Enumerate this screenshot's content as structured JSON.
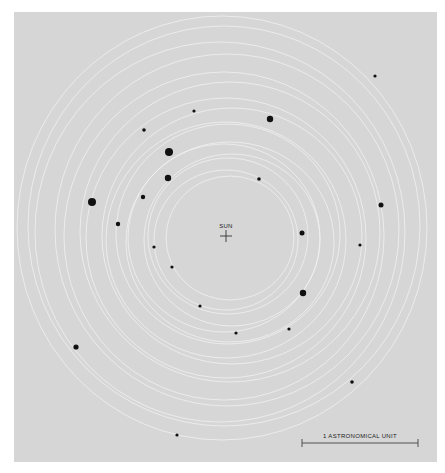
{
  "figure": {
    "background_color": "#d6d6d6",
    "orbit_color": "#f2f2f2",
    "body_color": "#111111",
    "sun": {
      "label": "SUN",
      "x": 226,
      "y": 236
    },
    "scale_bar": {
      "label": "1 ASTRONOMICAL UNIT",
      "x1": 302,
      "x2": 418,
      "y": 443
    },
    "orbits": [
      {
        "cx": 222,
        "cy": 228,
        "rx": 205,
        "ry": 212
      },
      {
        "cx": 224,
        "cy": 226,
        "rx": 196,
        "ry": 200
      },
      {
        "cx": 220,
        "cy": 232,
        "rx": 185,
        "ry": 190
      },
      {
        "cx": 227,
        "cy": 230,
        "rx": 172,
        "ry": 176
      },
      {
        "cx": 224,
        "cy": 236,
        "rx": 160,
        "ry": 164
      },
      {
        "cx": 230,
        "cy": 232,
        "rx": 150,
        "ry": 150
      },
      {
        "cx": 226,
        "cy": 238,
        "rx": 140,
        "ry": 140
      },
      {
        "cx": 232,
        "cy": 236,
        "rx": 130,
        "ry": 128
      },
      {
        "cx": 226,
        "cy": 240,
        "rx": 120,
        "ry": 118
      },
      {
        "cx": 228,
        "cy": 234,
        "rx": 112,
        "ry": 110
      },
      {
        "cx": 230,
        "cy": 242,
        "rx": 104,
        "ry": 100
      },
      {
        "cx": 224,
        "cy": 238,
        "rx": 96,
        "ry": 94
      },
      {
        "cx": 232,
        "cy": 240,
        "rx": 88,
        "ry": 86
      },
      {
        "cx": 228,
        "cy": 236,
        "rx": 80,
        "ry": 78
      },
      {
        "cx": 226,
        "cy": 240,
        "rx": 72,
        "ry": 70
      },
      {
        "cx": 230,
        "cy": 238,
        "rx": 64,
        "ry": 62
      }
    ],
    "bodies": [
      {
        "x": 375,
        "y": 76,
        "r": 1.6
      },
      {
        "x": 194,
        "y": 111,
        "r": 1.6
      },
      {
        "x": 270,
        "y": 119,
        "r": 3.2
      },
      {
        "x": 144,
        "y": 130,
        "r": 1.8
      },
      {
        "x": 169,
        "y": 152,
        "r": 4.0
      },
      {
        "x": 168,
        "y": 178,
        "r": 3.2
      },
      {
        "x": 259,
        "y": 179,
        "r": 1.8
      },
      {
        "x": 92,
        "y": 202,
        "r": 4.0
      },
      {
        "x": 143,
        "y": 197,
        "r": 2.2
      },
      {
        "x": 381,
        "y": 205,
        "r": 2.5
      },
      {
        "x": 118,
        "y": 224,
        "r": 2.2
      },
      {
        "x": 302,
        "y": 233,
        "r": 2.5
      },
      {
        "x": 360,
        "y": 245,
        "r": 1.6
      },
      {
        "x": 154,
        "y": 247,
        "r": 1.6
      },
      {
        "x": 172,
        "y": 267,
        "r": 1.6
      },
      {
        "x": 303,
        "y": 293,
        "r": 3.2
      },
      {
        "x": 200,
        "y": 306,
        "r": 1.6
      },
      {
        "x": 289,
        "y": 329,
        "r": 1.6
      },
      {
        "x": 236,
        "y": 333,
        "r": 1.6
      },
      {
        "x": 76,
        "y": 347,
        "r": 2.6
      },
      {
        "x": 352,
        "y": 382,
        "r": 1.8
      },
      {
        "x": 177,
        "y": 435,
        "r": 1.6
      }
    ]
  }
}
